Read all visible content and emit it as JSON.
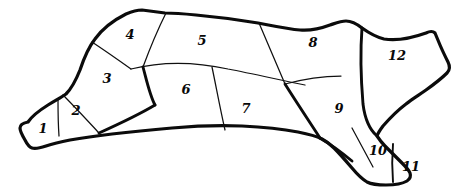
{
  "figure": {
    "kind": "butchery-cut-chart",
    "background_color": "#ffffff",
    "ink_color": "#0b0b0b",
    "outline_stroke_color": "#0b0b0b",
    "cut_line_color": "#101010",
    "width": 464,
    "height": 192
  },
  "regions": [
    {
      "id": "region-1",
      "label": "1",
      "x": 43,
      "y": 128
    },
    {
      "id": "region-2",
      "label": "2",
      "x": 76,
      "y": 110
    },
    {
      "id": "region-3",
      "label": "3",
      "x": 107,
      "y": 78
    },
    {
      "id": "region-4",
      "label": "4",
      "x": 130,
      "y": 34
    },
    {
      "id": "region-5",
      "label": "5",
      "x": 202,
      "y": 40
    },
    {
      "id": "region-6",
      "label": "6",
      "x": 186,
      "y": 89
    },
    {
      "id": "region-7",
      "label": "7",
      "x": 246,
      "y": 108
    },
    {
      "id": "region-8",
      "label": "8",
      "x": 313,
      "y": 42
    },
    {
      "id": "region-9",
      "label": "9",
      "x": 339,
      "y": 108
    },
    {
      "id": "region-10",
      "label": "10",
      "x": 378,
      "y": 150
    },
    {
      "id": "region-11",
      "label": "11",
      "x": 411,
      "y": 166
    },
    {
      "id": "region-12",
      "label": "12",
      "x": 397,
      "y": 55
    }
  ]
}
